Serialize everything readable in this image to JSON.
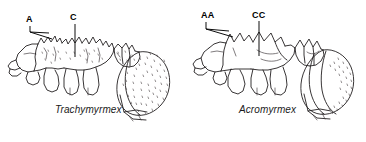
{
  "figure": {
    "background_color": "#ffffff",
    "ink_color": "#231f20",
    "width": 366,
    "height": 142
  },
  "panels": [
    {
      "id": "left",
      "species_label": "Trachymyrmex",
      "species_x": 55,
      "species_y": 104,
      "callouts": [
        {
          "id": "a",
          "label": "A",
          "x": 28,
          "y": 16,
          "leader_style": "double-line-wedge",
          "target": "anterior-pronotal-spines"
        },
        {
          "id": "c",
          "label": "C",
          "x": 72,
          "y": 14,
          "leader_style": "single-vertical-line",
          "target": "mesonotal-tubercles"
        }
      ],
      "gaster_texture": "dense-tubercles-over-entire-surface",
      "thorax_texture": "tuberculate-rugose"
    },
    {
      "id": "right",
      "species_label": "Acromyrmex",
      "species_x": 239,
      "species_y": 104,
      "callouts": [
        {
          "id": "aa",
          "label": "AA",
          "x": 201,
          "y": 12,
          "leader_style": "double-line-wedge",
          "target": "anterior-pronotal-spines"
        },
        {
          "id": "cc",
          "label": "CC",
          "x": 252,
          "y": 12,
          "leader_style": "single-vertical-line",
          "target": "mesonotal-surface"
        }
      ],
      "gaster_texture": "smooth-with-tubercles-on-posterior-margin-only",
      "thorax_texture": "smooth-with-few-large-spines"
    }
  ]
}
